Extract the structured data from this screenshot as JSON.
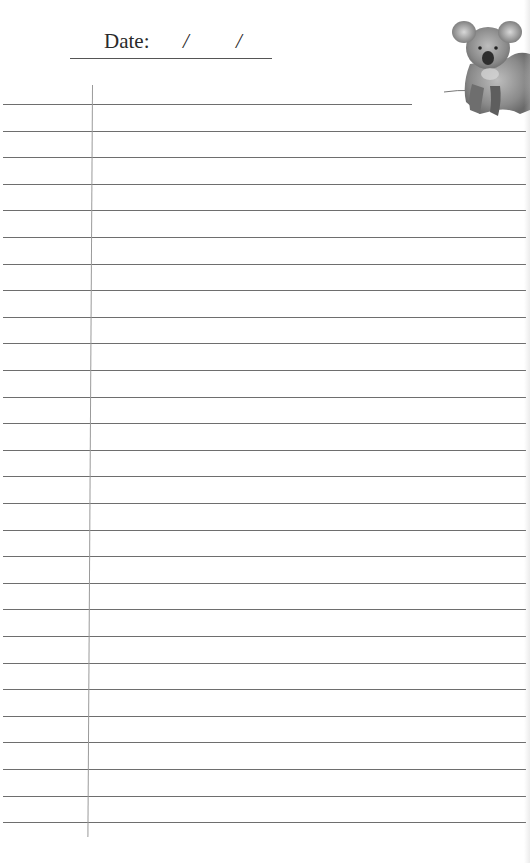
{
  "header": {
    "date_label": "Date:",
    "date_separator_1": "/",
    "date_separator_2": "/",
    "date_value_day": "",
    "date_value_month": "",
    "date_value_year": ""
  },
  "illustration": {
    "subject": "koala-illustration",
    "style": "pencil sketch, grayscale"
  },
  "ruled_area": {
    "line_count": 28,
    "first_line_y": 104,
    "line_spacing": 26.6,
    "first_line_right": 412,
    "line_right": 526,
    "margin_line_x": 92,
    "line_color": "#555555",
    "margin_line_color": "#9a9a9a"
  }
}
